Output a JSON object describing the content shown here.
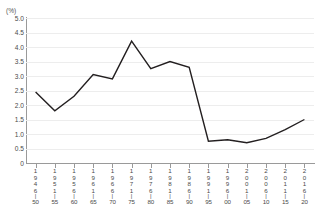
{
  "chart_data": {
    "type": "line",
    "title": "",
    "xlabel": "",
    "ylabel": "(%)",
    "unit": "(%)",
    "ylim": [
      0,
      5.0
    ],
    "ytick_labels": [
      "5.0",
      "4.5",
      "4.0",
      "3.5",
      "3.0",
      "2.5",
      "2.0",
      "1.5",
      "1.0",
      "0.5",
      "0"
    ],
    "ytick_values": [
      5.0,
      4.5,
      4.0,
      3.5,
      3.0,
      2.5,
      2.0,
      1.5,
      1.0,
      0.5,
      0
    ],
    "grid": true,
    "legend": "none",
    "line_color": "#231f20",
    "categories": [
      "1946-50",
      "1951-55",
      "1956-60",
      "1961-65",
      "1966-70",
      "1971-75",
      "1976-80",
      "1981-85",
      "1986-90",
      "1991-95",
      "1996-00",
      "2001-05",
      "2006-10",
      "2011-15",
      "2016-20"
    ],
    "category_parts": [
      {
        "start": "1946",
        "end": "50"
      },
      {
        "start": "1951",
        "end": "55"
      },
      {
        "start": "1956",
        "end": "60"
      },
      {
        "start": "1961",
        "end": "65"
      },
      {
        "start": "1966",
        "end": "70"
      },
      {
        "start": "1971",
        "end": "75"
      },
      {
        "start": "1976",
        "end": "80"
      },
      {
        "start": "1981",
        "end": "85"
      },
      {
        "start": "1986",
        "end": "90"
      },
      {
        "start": "1991",
        "end": "95"
      },
      {
        "start": "1996",
        "end": "00"
      },
      {
        "start": "2001",
        "end": "05"
      },
      {
        "start": "2006",
        "end": "10"
      },
      {
        "start": "2011",
        "end": "15"
      },
      {
        "start": "2016",
        "end": "20"
      }
    ],
    "values": [
      2.45,
      1.8,
      2.3,
      3.05,
      2.9,
      4.2,
      3.25,
      3.5,
      3.3,
      0.75,
      0.8,
      0.7,
      0.85,
      1.15,
      1.5
    ]
  }
}
